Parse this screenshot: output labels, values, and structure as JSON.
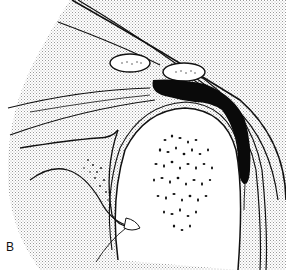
{
  "figure": {
    "panel_label": "B",
    "colors": {
      "line": "#111111",
      "background": "#ffffff",
      "stipple": "#9a9a9a",
      "fluid": "#0a0a0a"
    }
  }
}
